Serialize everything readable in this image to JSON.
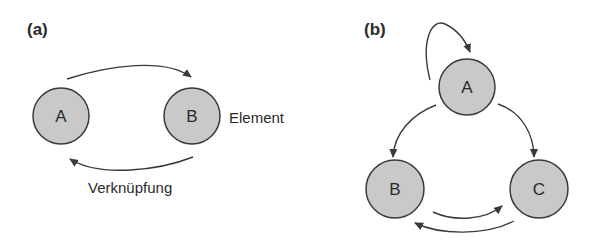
{
  "panels": [
    {
      "label": "(a)",
      "nodes": [
        {
          "id": "A",
          "label": "A"
        },
        {
          "id": "B",
          "label": "B"
        }
      ],
      "annotations": {
        "element": "Element",
        "link": "Verknüpfung"
      },
      "edges": [
        {
          "from": "A",
          "to": "B"
        },
        {
          "from": "B",
          "to": "A"
        }
      ]
    },
    {
      "label": "(b)",
      "nodes": [
        {
          "id": "A",
          "label": "A"
        },
        {
          "id": "B",
          "label": "B"
        },
        {
          "id": "C",
          "label": "C"
        }
      ],
      "edges": [
        {
          "from": "A",
          "to": "A"
        },
        {
          "from": "A",
          "to": "B"
        },
        {
          "from": "A",
          "to": "C"
        },
        {
          "from": "B",
          "to": "C"
        },
        {
          "from": "C",
          "to": "B"
        }
      ]
    }
  ],
  "colors": {
    "node_fill": "#c9c9c9",
    "stroke": "#3a3a3a",
    "text": "#2a2a2a"
  }
}
